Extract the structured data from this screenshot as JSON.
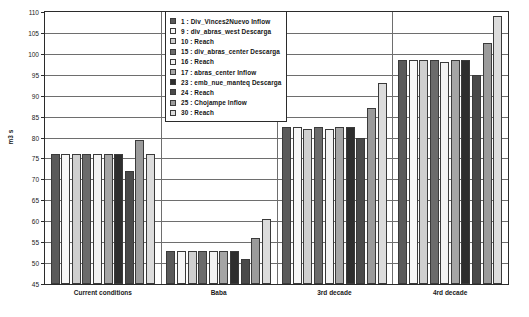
{
  "chart_data": {
    "type": "bar",
    "title": "",
    "xlabel": "",
    "ylabel": "m3 s",
    "ylim": [
      45,
      110
    ],
    "ytick_step": 5,
    "yticks": [
      45,
      50,
      55,
      60,
      65,
      70,
      75,
      80,
      85,
      90,
      95,
      100,
      105,
      110
    ],
    "grid": true,
    "legend_position": "top-center-inside",
    "categories": [
      "Current conditions",
      "Baba",
      "3rd decade",
      "4rd decade"
    ],
    "series": [
      {
        "name": "1 : Div_Vinces2Nuevo Inflow",
        "color": "#5a5a5a",
        "values": [
          76.0,
          53.0,
          82.5,
          98.5
        ]
      },
      {
        "name": "9 : div_abras_west Descarga",
        "color": "#f7f7f7",
        "values": [
          76.0,
          53.0,
          82.5,
          98.5
        ]
      },
      {
        "name": "10 : Reach",
        "color": "#cfcfcf",
        "values": [
          76.0,
          53.0,
          82.0,
          98.5
        ]
      },
      {
        "name": "15 : div_abras_center Descarga",
        "color": "#6b6b6b",
        "values": [
          76.0,
          53.0,
          82.5,
          98.5
        ]
      },
      {
        "name": "16 : Reach",
        "color": "#f2f2f2",
        "values": [
          76.0,
          53.0,
          82.0,
          98.0
        ]
      },
      {
        "name": "17 : abras_center Inflow",
        "color": "#a5a5a5",
        "values": [
          76.0,
          53.0,
          82.5,
          98.5
        ]
      },
      {
        "name": "23 : emb_nue_manteq Descarga",
        "color": "#2e2e2e",
        "values": [
          76.0,
          53.0,
          82.5,
          98.5
        ]
      },
      {
        "name": "24 : Reach",
        "color": "#4a4a4a",
        "values": [
          72.0,
          51.0,
          80.0,
          95.0
        ]
      },
      {
        "name": "25 : Chojampe Inflow",
        "color": "#9b9b9b",
        "values": [
          79.5,
          56.0,
          87.0,
          102.5
        ]
      },
      {
        "name": "30 : Reach",
        "color": "#dcdcdc",
        "values": [
          76.0,
          60.5,
          93.0,
          109.0
        ]
      }
    ]
  },
  "legend": {
    "items": [
      {
        "label": "1 : Div_Vinces2Nuevo Inflow",
        "color": "#5a5a5a"
      },
      {
        "label": "9 : div_abras_west Descarga",
        "color": "#f7f7f7"
      },
      {
        "label": "10 : Reach",
        "color": "#cfcfcf"
      },
      {
        "label": "15 : div_abras_center Descarga",
        "color": "#6b6b6b"
      },
      {
        "label": "16 : Reach",
        "color": "#f2f2f2"
      },
      {
        "label": "17 : abras_center Inflow",
        "color": "#a5a5a5"
      },
      {
        "label": "23 : emb_nue_manteq Descarga",
        "color": "#2e2e2e"
      },
      {
        "label": "24 : Reach",
        "color": "#4a4a4a"
      },
      {
        "label": "25 : Chojampe Inflow",
        "color": "#9b9b9b"
      },
      {
        "label": "30 : Reach",
        "color": "#dcdcdc"
      }
    ]
  }
}
